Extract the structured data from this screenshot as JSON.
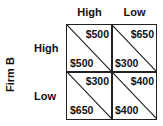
{
  "column_headers": [
    "High",
    "Low"
  ],
  "row_headers": [
    "High",
    "Low"
  ],
  "row_player_label": "Firm B",
  "cells": [
    {
      "row": "High",
      "col": "High",
      "top_right": "$500",
      "bottom_left": "$500"
    },
    {
      "row": "High",
      "col": "Low",
      "top_right": "$650",
      "bottom_left": "$300"
    },
    {
      "row": "Low",
      "col": "High",
      "top_right": "$300",
      "bottom_left": "$650"
    },
    {
      "row": "Low",
      "col": "Low",
      "top_right": "$400",
      "bottom_left": "$400"
    }
  ]
}
